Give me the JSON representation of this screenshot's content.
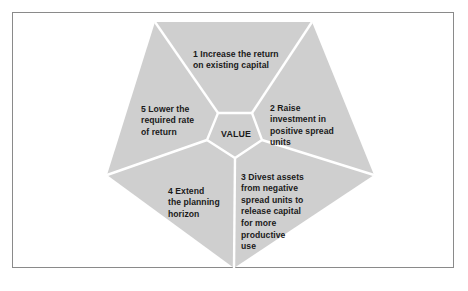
{
  "diagram": {
    "center": {
      "label": "VALUE"
    },
    "segments": [
      {
        "id": 1,
        "number": "1",
        "text": "Increase the return\non existing capital"
      },
      {
        "id": 2,
        "number": "2",
        "text": "Raise\ninvestment in\npositive spread\nunits"
      },
      {
        "id": 3,
        "number": "3",
        "text": "Divest assets\nfrom negative\nspread units to\nrelease capital\nfor more\nproductive\nuse"
      },
      {
        "id": 4,
        "number": "4",
        "text": "Extend\nthe planning\nhorizon"
      },
      {
        "id": 5,
        "number": "5",
        "text": "Lower the\nrequired rate\nof return"
      }
    ],
    "colors": {
      "segment_fill": "#cfcfcf",
      "separator": "#ffffff",
      "frame_border": "#8a8a8a",
      "text": "#1a1a1a"
    }
  }
}
